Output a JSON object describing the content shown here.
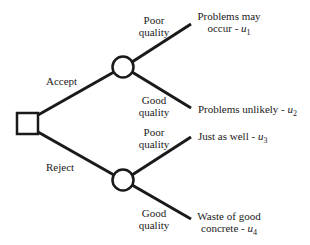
{
  "diagram": {
    "type": "decision-tree",
    "colors": {
      "line": "#1a1a1a",
      "background": "#ffffff"
    },
    "decision_node": {
      "shape": "square",
      "label": ""
    },
    "branches": [
      {
        "label": "Accept",
        "chance_node": {
          "shape": "circle"
        },
        "outcomes": [
          {
            "condition": {
              "line1": "Poor",
              "line2": "quality"
            },
            "result": {
              "line1": "Problems may",
              "line2_text": "occur - ",
              "utility_symbol": "u",
              "utility_index": "1"
            }
          },
          {
            "condition": {
              "line1": "Good",
              "line2": "quality"
            },
            "result": {
              "line1_text": "Problems unlikely - ",
              "utility_symbol": "u",
              "utility_index": "2"
            }
          }
        ]
      },
      {
        "label": "Reject",
        "chance_node": {
          "shape": "circle"
        },
        "outcomes": [
          {
            "condition": {
              "line1": "Poor",
              "line2": "quality"
            },
            "result": {
              "line1_text": "Just as well - ",
              "utility_symbol": "u",
              "utility_index": "3"
            }
          },
          {
            "condition": {
              "line1": "Good",
              "line2": "quality"
            },
            "result": {
              "line1": "Waste of good",
              "line2_text": "concrete - ",
              "utility_symbol": "u",
              "utility_index": "4"
            }
          }
        ]
      }
    ]
  }
}
